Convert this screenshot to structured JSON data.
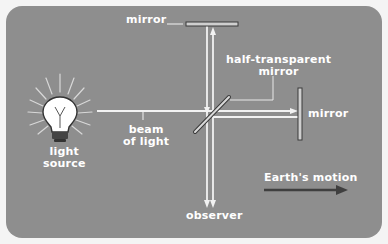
{
  "diagram": {
    "colors": {
      "background": "#8e8e8e",
      "beam": "#f2f2f2",
      "mirror_fill": "#cfcfcf",
      "mirror_outline": "#3a3a3a",
      "motion_arrow": "#3f3f3f",
      "text": "#ffffff"
    },
    "labels": {
      "top_mirror": "mirror",
      "half_transparent_mirror_line1": "half-transparent",
      "half_transparent_mirror_line2": "mirror",
      "right_mirror": "mirror",
      "beam_line1": "beam",
      "beam_line2": "of light",
      "light_source_line1": "light",
      "light_source_line2": "source",
      "observer": "observer",
      "earth_motion": "Earth's motion"
    },
    "components": [
      {
        "id": "light-source",
        "icon": "light-bulb-icon"
      },
      {
        "id": "beam-splitter",
        "type": "half-transparent mirror"
      },
      {
        "id": "top-mirror",
        "type": "mirror"
      },
      {
        "id": "right-mirror",
        "type": "mirror"
      },
      {
        "id": "observer",
        "type": "detector"
      },
      {
        "id": "earth-motion-arrow",
        "icon": "arrow-right-icon",
        "direction": "right"
      }
    ]
  }
}
